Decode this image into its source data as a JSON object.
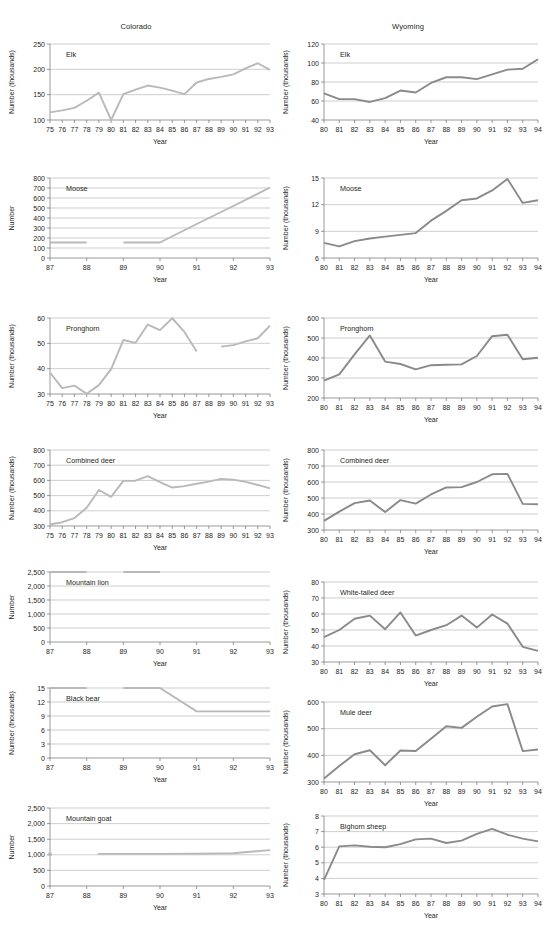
{
  "figure": {
    "columns": [
      {
        "id": "colorado",
        "title": "Colorado",
        "line_color": "#b9b9b9"
      },
      {
        "id": "wyoming",
        "title": "Wyoming",
        "line_color": "#8a8a8a"
      }
    ],
    "axis_titles": {
      "x": "Year",
      "y_number": "Number",
      "y_thousands": "Number (thousands)"
    }
  },
  "chart_data": [
    {
      "id": "colorado-elk",
      "type": "line",
      "column": "Colorado",
      "title": "Elk",
      "xlabel": "Year",
      "ylabel": "Number (thousands)",
      "grid": true,
      "legend": "none",
      "xlim": [
        75,
        93
      ],
      "ylim": [
        100,
        250
      ],
      "yticks": [
        100,
        150,
        200,
        250
      ],
      "xticks": [
        "75",
        "76",
        "77",
        "78",
        "79",
        "80",
        "81",
        "82",
        "83",
        "84",
        "85",
        "86",
        "87",
        "88",
        "89",
        "90",
        "91",
        "92",
        "93"
      ],
      "x": [
        75,
        76,
        77,
        78,
        79,
        80,
        81,
        82,
        83,
        84,
        85,
        86,
        87,
        88,
        89,
        90,
        91,
        92,
        93
      ],
      "values": [
        115,
        119,
        124,
        138,
        154,
        100,
        151,
        160,
        168,
        164,
        158,
        151,
        174,
        181,
        185,
        190,
        202,
        212,
        199
      ]
    },
    {
      "id": "wyoming-elk",
      "type": "line",
      "column": "Wyoming",
      "title": "Elk",
      "xlabel": "Year",
      "ylabel": "Number (thousands)",
      "grid": true,
      "legend": "none",
      "xlim": [
        80,
        94
      ],
      "ylim": [
        40,
        120
      ],
      "yticks": [
        40,
        60,
        80,
        100,
        120
      ],
      "xticks": [
        "80",
        "81",
        "82",
        "83",
        "84",
        "85",
        "86",
        "87",
        "88",
        "89",
        "90",
        "91",
        "92",
        "93",
        "94"
      ],
      "x": [
        80,
        81,
        82,
        83,
        84,
        85,
        86,
        87,
        88,
        89,
        90,
        91,
        92,
        93,
        94
      ],
      "values": [
        68,
        62,
        62,
        59,
        63,
        71,
        69,
        79,
        85,
        85,
        83,
        88,
        93,
        94,
        104
      ]
    },
    {
      "id": "colorado-moose",
      "type": "line",
      "column": "Colorado",
      "title": "Moose",
      "xlabel": "Year",
      "ylabel": "Number",
      "grid": true,
      "legend": "none",
      "xlim": [
        87,
        93
      ],
      "ylim": [
        0,
        800
      ],
      "yticks": [
        0,
        100,
        200,
        300,
        400,
        500,
        600,
        700,
        800
      ],
      "xticks": [
        "87",
        "88",
        "89",
        "90",
        "91",
        "92",
        "93"
      ],
      "segments": [
        {
          "x": [
            87,
            88
          ],
          "values": [
            155,
            155
          ]
        },
        {
          "x": [
            89,
            90,
            91,
            92,
            93
          ],
          "values": [
            155,
            155,
            340,
            520,
            705
          ]
        }
      ]
    },
    {
      "id": "wyoming-moose",
      "type": "line",
      "column": "Wyoming",
      "title": "Moose",
      "xlabel": "Year",
      "ylabel": "Number (thousands)",
      "grid": true,
      "legend": "none",
      "xlim": [
        80,
        94
      ],
      "ylim": [
        6,
        15
      ],
      "yticks": [
        6,
        9,
        12,
        15
      ],
      "xticks": [
        "80",
        "81",
        "82",
        "83",
        "84",
        "85",
        "86",
        "87",
        "88",
        "89",
        "90",
        "91",
        "92",
        "93",
        "94"
      ],
      "x": [
        80,
        81,
        82,
        83,
        84,
        85,
        86,
        87,
        88,
        89,
        90,
        91,
        92,
        93,
        94
      ],
      "values": [
        7.7,
        7.3,
        7.9,
        8.2,
        8.4,
        8.6,
        8.8,
        10.2,
        11.3,
        12.5,
        12.7,
        13.6,
        14.9,
        12.2,
        12.5
      ]
    },
    {
      "id": "colorado-pronghorn",
      "type": "line",
      "column": "Colorado",
      "title": "Pronghorn",
      "xlabel": "Year",
      "ylabel": "Number (thousands)",
      "grid": true,
      "legend": "none",
      "xlim": [
        75,
        93
      ],
      "ylim": [
        30,
        60
      ],
      "yticks": [
        30,
        40,
        50,
        60
      ],
      "xticks": [
        "75",
        "76",
        "77",
        "78",
        "79",
        "80",
        "81",
        "82",
        "83",
        "84",
        "85",
        "86",
        "87",
        "88",
        "89",
        "90",
        "91",
        "92",
        "93"
      ],
      "segments": [
        {
          "x": [
            75,
            76,
            77,
            78,
            79,
            80,
            81,
            82,
            83,
            84,
            85,
            86,
            87
          ],
          "values": [
            38.5,
            32.3,
            33.3,
            30.1,
            33.5,
            39.8,
            51.3,
            50.2,
            57.4,
            55.2,
            59.9,
            54.5,
            46.8
          ]
        },
        {
          "x": [
            89,
            90,
            91,
            92,
            93
          ],
          "values": [
            48.7,
            49.3,
            50.8,
            52,
            57
          ]
        }
      ]
    },
    {
      "id": "wyoming-pronghorn",
      "type": "line",
      "column": "Wyoming",
      "title": "Pronghorn",
      "xlabel": "Year",
      "ylabel": "Number (thousands)",
      "grid": true,
      "legend": "none",
      "xlim": [
        80,
        94
      ],
      "ylim": [
        200,
        600
      ],
      "yticks": [
        200,
        300,
        400,
        500,
        600
      ],
      "xticks": [
        "80",
        "81",
        "82",
        "83",
        "84",
        "85",
        "86",
        "87",
        "88",
        "89",
        "90",
        "91",
        "92",
        "93",
        "94"
      ],
      "x": [
        80,
        81,
        82,
        83,
        84,
        85,
        86,
        87,
        88,
        89,
        90,
        91,
        92,
        93,
        94
      ],
      "values": [
        287,
        318,
        418,
        513,
        382,
        370,
        343,
        364,
        366,
        368,
        410,
        509,
        516,
        394,
        401
      ]
    },
    {
      "id": "colorado-combined-deer",
      "type": "line",
      "column": "Colorado",
      "title": "Combined deer",
      "xlabel": "Year",
      "ylabel": "Number (thousands)",
      "grid": true,
      "legend": "none",
      "xlim": [
        75,
        93
      ],
      "ylim": [
        300,
        800
      ],
      "yticks": [
        300,
        400,
        500,
        600,
        700,
        800
      ],
      "xticks": [
        "75",
        "76",
        "77",
        "78",
        "79",
        "80",
        "81",
        "82",
        "83",
        "84",
        "85",
        "86",
        "87",
        "88",
        "89",
        "90",
        "91",
        "92",
        "93"
      ],
      "x": [
        75,
        76,
        77,
        78,
        79,
        80,
        81,
        82,
        83,
        84,
        85,
        86,
        87,
        88,
        89,
        90,
        91,
        92,
        93
      ],
      "values": [
        310,
        325,
        352,
        420,
        537,
        492,
        597,
        598,
        628,
        588,
        553,
        562,
        578,
        592,
        610,
        605,
        590,
        570,
        547
      ]
    },
    {
      "id": "wyoming-combined-deer",
      "type": "line",
      "column": "Wyoming",
      "title": "Combined deer",
      "xlabel": "Year",
      "ylabel": "Number (thousands)",
      "grid": true,
      "legend": "none",
      "xlim": [
        80,
        94
      ],
      "ylim": [
        300,
        800
      ],
      "yticks": [
        300,
        400,
        500,
        600,
        700,
        800
      ],
      "xticks": [
        "80",
        "81",
        "82",
        "83",
        "84",
        "85",
        "86",
        "87",
        "88",
        "89",
        "90",
        "91",
        "92",
        "93",
        "94"
      ],
      "x": [
        80,
        81,
        82,
        83,
        84,
        85,
        86,
        87,
        88,
        89,
        90,
        91,
        92,
        93,
        94
      ],
      "values": [
        357,
        415,
        468,
        484,
        412,
        487,
        465,
        522,
        566,
        568,
        600,
        648,
        651,
        463,
        461
      ]
    },
    {
      "id": "colorado-mountain-lion",
      "type": "line",
      "column": "Colorado",
      "title": "Mountain lion",
      "xlabel": "Year",
      "ylabel": "Number",
      "grid": true,
      "legend": "none",
      "xlim": [
        87,
        93
      ],
      "ylim": [
        0,
        2500
      ],
      "yticks": [
        0,
        500,
        1000,
        1500,
        2000,
        2500
      ],
      "ytick_labels": [
        "0",
        "500",
        "1,000",
        "1,500",
        "2,000",
        "2,500"
      ],
      "xticks": [
        "87",
        "88",
        "89",
        "90",
        "91",
        "92",
        "93"
      ],
      "segments": [
        {
          "x": [
            87,
            88
          ],
          "values": [
            2500,
            2500
          ]
        },
        {
          "x": [
            89,
            90
          ],
          "values": [
            2500,
            2500
          ]
        }
      ]
    },
    {
      "id": "wyoming-white-tailed-deer",
      "type": "line",
      "column": "Wyoming",
      "title": "White-tailed deer",
      "xlabel": "Year",
      "ylabel": "Number (thousands)",
      "grid": true,
      "legend": "none",
      "xlim": [
        80,
        94
      ],
      "ylim": [
        30,
        80
      ],
      "yticks": [
        30,
        40,
        50,
        60,
        70,
        80
      ],
      "xticks": [
        "80",
        "81",
        "82",
        "83",
        "84",
        "85",
        "86",
        "87",
        "88",
        "89",
        "90",
        "91",
        "92",
        "93",
        "94"
      ],
      "x": [
        80,
        81,
        82,
        83,
        84,
        85,
        86,
        87,
        88,
        89,
        90,
        91,
        92,
        93,
        94
      ],
      "values": [
        45.5,
        50,
        57,
        59,
        50.5,
        61,
        46.5,
        50,
        53,
        59,
        51.5,
        59.7,
        54,
        39.5,
        37
      ]
    },
    {
      "id": "colorado-black-bear",
      "type": "line",
      "column": "Colorado",
      "title": "Black bear",
      "xlabel": "Year",
      "ylabel": "Number (thousands)",
      "grid": true,
      "legend": "none",
      "xlim": [
        87,
        93
      ],
      "ylim": [
        0,
        15
      ],
      "yticks": [
        0,
        3,
        6,
        9,
        12,
        15
      ],
      "xticks": [
        "87",
        "88",
        "89",
        "90",
        "91",
        "92",
        "93"
      ],
      "segments": [
        {
          "x": [
            87,
            88
          ],
          "values": [
            15,
            15
          ]
        },
        {
          "x": [
            89,
            90,
            91,
            92,
            93
          ],
          "values": [
            15,
            15,
            10,
            10,
            10
          ]
        }
      ]
    },
    {
      "id": "wyoming-mule-deer",
      "type": "line",
      "column": "Wyoming",
      "title": "Mule deer",
      "xlabel": "Year",
      "ylabel": "Number (thousands)",
      "grid": true,
      "legend": "none",
      "xlim": [
        80,
        94
      ],
      "ylim": [
        300,
        600
      ],
      "yticks": [
        300,
        400,
        500,
        600
      ],
      "xticks": [
        "80",
        "81",
        "82",
        "83",
        "84",
        "85",
        "86",
        "87",
        "88",
        "89",
        "90",
        "91",
        "92",
        "93",
        "94"
      ],
      "x": [
        80,
        81,
        82,
        83,
        84,
        85,
        86,
        87,
        88,
        89,
        90,
        91,
        92,
        93,
        94
      ],
      "values": [
        313,
        360,
        404,
        419,
        363,
        418,
        416,
        462,
        509,
        503,
        545,
        583,
        592,
        416,
        422
      ]
    },
    {
      "id": "colorado-mountain-goat",
      "type": "line",
      "column": "Colorado",
      "title": "Mountain goat",
      "xlabel": "Year",
      "ylabel": "Number",
      "grid": true,
      "legend": "none",
      "xlim": [
        87,
        93
      ],
      "ylim": [
        0,
        2500
      ],
      "yticks": [
        0,
        500,
        1000,
        1500,
        2000,
        2500
      ],
      "ytick_labels": [
        "0",
        "500",
        "1,000",
        "1,500",
        "2,000",
        "2,500"
      ],
      "xticks": [
        "87",
        "88",
        "89",
        "90",
        "91",
        "92",
        "93"
      ],
      "points": [
        {
          "x": 87,
          "value": 1020
        }
      ],
      "segments": [
        {
          "x": [
            88.3,
            89,
            90,
            91,
            92,
            93
          ],
          "values": [
            1030,
            1030,
            1030,
            1035,
            1050,
            1150
          ]
        }
      ]
    },
    {
      "id": "wyoming-bighorn-sheep",
      "type": "line",
      "column": "Wyoming",
      "title": "Bighorn sheep",
      "xlabel": "Year",
      "ylabel": "Number (thousands)",
      "grid": true,
      "legend": "none",
      "xlim": [
        80,
        94
      ],
      "ylim": [
        3,
        8
      ],
      "yticks": [
        3,
        4,
        5,
        6,
        7,
        8
      ],
      "xticks": [
        "80",
        "81",
        "82",
        "83",
        "84",
        "85",
        "86",
        "87",
        "88",
        "89",
        "90",
        "91",
        "92",
        "93",
        "94"
      ],
      "x": [
        80,
        81,
        82,
        83,
        84,
        85,
        86,
        87,
        88,
        89,
        90,
        91,
        92,
        93,
        94
      ],
      "values": [
        3.9,
        6.05,
        6.12,
        6.03,
        6.0,
        6.2,
        6.5,
        6.55,
        6.27,
        6.42,
        6.85,
        7.18,
        6.8,
        6.55,
        6.37
      ]
    }
  ]
}
